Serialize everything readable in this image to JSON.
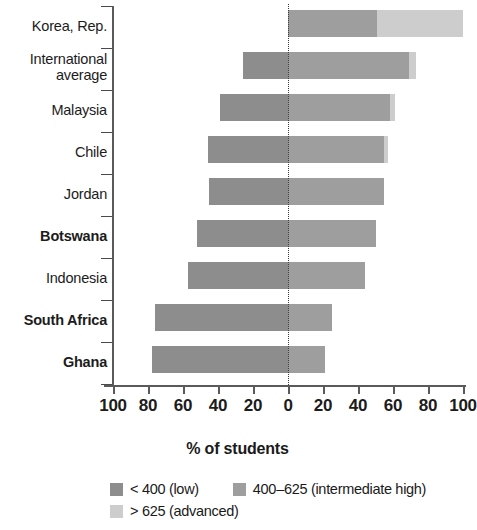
{
  "chart_data": {
    "type": "bar",
    "subtype": "diverging-stacked-bar",
    "title": "",
    "xlabel": "% of students",
    "ylabel": "",
    "xlim": [
      -100,
      100
    ],
    "x_ticks": [
      100,
      80,
      60,
      40,
      20,
      0,
      20,
      40,
      60,
      80,
      100
    ],
    "grid": false,
    "zero_reference_line": true,
    "legend_position": "bottom",
    "categories": [
      "Korea, Rep.",
      "International average",
      "Malaysia",
      "Chile",
      "Jordan",
      "Botswana",
      "Indonesia",
      "South Africa",
      "Ghana"
    ],
    "series": [
      {
        "name": "< 400 (low)",
        "color": "#8d8d8d",
        "direction": "left",
        "values": [
          0,
          26,
          39,
          46,
          45,
          52,
          57,
          76,
          78
        ]
      },
      {
        "name": "400–625 (intermediate high)",
        "color": "#9e9e9e",
        "direction": "right",
        "values": [
          51,
          69,
          58,
          55,
          55,
          50,
          44,
          25,
          21
        ]
      },
      {
        "name": "> 625 (advanced)",
        "color": "#cdcdcd",
        "direction": "right",
        "values": [
          49,
          4,
          3,
          2,
          0,
          0,
          0,
          0,
          0
        ]
      }
    ]
  },
  "axis": {
    "title": "% of students",
    "tick_labels": [
      "100",
      "80",
      "60",
      "40",
      "20",
      "0",
      "20",
      "40",
      "60",
      "80",
      "100"
    ]
  },
  "categories": [
    {
      "label": "Korea, Rep.",
      "bold": false
    },
    {
      "label": "International\naverage",
      "bold": false
    },
    {
      "label": "Malaysia",
      "bold": false
    },
    {
      "label": "Chile",
      "bold": false
    },
    {
      "label": "Jordan",
      "bold": false
    },
    {
      "label": "Botswana",
      "bold": true
    },
    {
      "label": "Indonesia",
      "bold": false
    },
    {
      "label": "South Africa",
      "bold": true
    },
    {
      "label": "Ghana",
      "bold": true
    }
  ],
  "legend": {
    "items": [
      {
        "label": "< 400 (low)",
        "color": "#8d8d8d"
      },
      {
        "label": "400–625 (intermediate high)",
        "color": "#9e9e9e"
      },
      {
        "label": "> 625 (advanced)",
        "color": "#cdcdcd"
      }
    ]
  }
}
